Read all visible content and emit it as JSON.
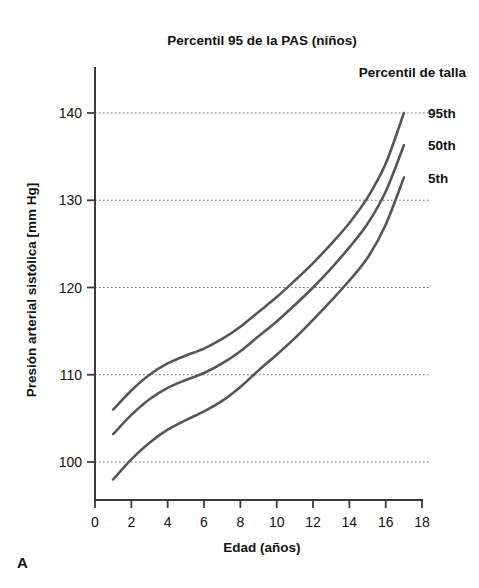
{
  "panel": {
    "label": "A"
  },
  "chart_data": {
    "type": "line",
    "title": "Percentil 95 de la PAS (niños)",
    "xlabel": "Edad (años)",
    "ylabel": "Presión arterial sistólica [mm Hg]",
    "legend_title": "Percentil de talla",
    "legend_position": "right-inside-top",
    "grid": true,
    "grid_axis": "y",
    "xlim": [
      0,
      18
    ],
    "ylim": [
      95,
      143
    ],
    "xticks": [
      0,
      2,
      4,
      6,
      8,
      10,
      12,
      14,
      16,
      18
    ],
    "xtick_labels": [
      "0",
      "2",
      "4",
      "6",
      "8",
      "10",
      "12",
      "14",
      "16",
      "18"
    ],
    "yticks": [
      100,
      110,
      120,
      130,
      140
    ],
    "ytick_labels": [
      "100",
      "110",
      "120",
      "130",
      "140"
    ],
    "x": [
      1,
      2,
      3,
      4,
      5,
      6,
      7,
      8,
      9,
      10,
      11,
      12,
      13,
      14,
      15,
      16,
      17
    ],
    "series": [
      {
        "name": "95th",
        "label": "95th",
        "color": "#565656",
        "values": [
          106.0,
          108.2,
          110.0,
          111.3,
          112.2,
          113.0,
          114.1,
          115.5,
          117.2,
          118.9,
          120.8,
          122.8,
          125.0,
          127.4,
          130.3,
          134.2,
          140.0
        ]
      },
      {
        "name": "50th",
        "label": "50th",
        "color": "#565656",
        "values": [
          103.2,
          105.4,
          107.2,
          108.5,
          109.4,
          110.2,
          111.3,
          112.7,
          114.4,
          116.1,
          118.0,
          120.0,
          122.2,
          124.6,
          127.3,
          131.0,
          136.3
        ]
      },
      {
        "name": "5th",
        "label": "5th",
        "color": "#565656",
        "values": [
          98.0,
          100.3,
          102.2,
          103.7,
          104.8,
          105.8,
          107.0,
          108.6,
          110.5,
          112.3,
          114.2,
          116.3,
          118.5,
          120.8,
          123.4,
          127.2,
          132.6
        ]
      }
    ]
  },
  "geometry": {
    "plot_left": 95,
    "plot_right": 422,
    "axis_top": 68,
    "axis_bottom": 500,
    "grid_right": 430,
    "y_value_at_bottom": 95,
    "px_per_year": 18.17,
    "px_per_mmhg": 8.725,
    "y_px_at_100": 462
  },
  "labels": {
    "title_x": 262,
    "title_y": 45,
    "legend_title_x": 466,
    "legend_title_y": 77,
    "series_label_x": 428,
    "xlabel_x": 262,
    "xlabel_y": 552,
    "ylabel_x": 36,
    "ylabel_y": 290,
    "panel_x": 17,
    "panel_y": 568
  }
}
